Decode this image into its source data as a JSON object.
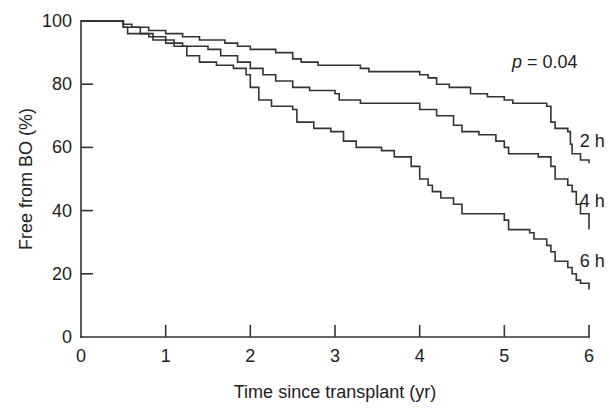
{
  "chart_data": {
    "type": "line",
    "subtype": "kaplan-meier step",
    "title": "",
    "xlabel": "Time since transplant (yr)",
    "ylabel": "Free from BO (%)",
    "xlim": [
      0,
      6
    ],
    "ylim": [
      0,
      100
    ],
    "xticks": [
      0,
      1,
      2,
      3,
      4,
      5,
      6
    ],
    "yticks": [
      0,
      20,
      40,
      60,
      80,
      100
    ],
    "grid": false,
    "annotation": "p = 0.04",
    "annotation_p_symbol": "p",
    "annotation_value": " = 0.04",
    "series": [
      {
        "name": "2 h",
        "points": [
          [
            0,
            100
          ],
          [
            0.25,
            100
          ],
          [
            0.5,
            99
          ],
          [
            0.6,
            98
          ],
          [
            0.8,
            97
          ],
          [
            1.0,
            96
          ],
          [
            1.2,
            95
          ],
          [
            1.4,
            94
          ],
          [
            1.7,
            93
          ],
          [
            1.85,
            92
          ],
          [
            2.0,
            91
          ],
          [
            2.3,
            90
          ],
          [
            2.5,
            88
          ],
          [
            2.6,
            87
          ],
          [
            2.8,
            86
          ],
          [
            3.0,
            86
          ],
          [
            3.3,
            85
          ],
          [
            3.4,
            84
          ],
          [
            3.7,
            84
          ],
          [
            4.0,
            83
          ],
          [
            4.1,
            82
          ],
          [
            4.2,
            80
          ],
          [
            4.35,
            79
          ],
          [
            4.6,
            77
          ],
          [
            4.8,
            76
          ],
          [
            5.0,
            75
          ],
          [
            5.1,
            74
          ],
          [
            5.2,
            74
          ],
          [
            5.5,
            73
          ],
          [
            5.55,
            68
          ],
          [
            5.6,
            66
          ],
          [
            5.75,
            65
          ],
          [
            5.78,
            61
          ],
          [
            5.8,
            58
          ],
          [
            5.9,
            56
          ],
          [
            6.0,
            55
          ]
        ]
      },
      {
        "name": "4 h",
        "points": [
          [
            0,
            100
          ],
          [
            0.3,
            100
          ],
          [
            0.5,
            98
          ],
          [
            0.7,
            96
          ],
          [
            0.85,
            94
          ],
          [
            1.0,
            93
          ],
          [
            1.2,
            92
          ],
          [
            1.5,
            91
          ],
          [
            1.65,
            89
          ],
          [
            1.85,
            87
          ],
          [
            2.0,
            85
          ],
          [
            2.15,
            83
          ],
          [
            2.3,
            81
          ],
          [
            2.5,
            79
          ],
          [
            2.7,
            78
          ],
          [
            3.0,
            77
          ],
          [
            3.05,
            75
          ],
          [
            3.3,
            74
          ],
          [
            3.8,
            74
          ],
          [
            4.0,
            72
          ],
          [
            4.2,
            70
          ],
          [
            4.4,
            67
          ],
          [
            4.5,
            65
          ],
          [
            4.7,
            64
          ],
          [
            4.9,
            62
          ],
          [
            5.0,
            60
          ],
          [
            5.05,
            58
          ],
          [
            5.2,
            58
          ],
          [
            5.4,
            57
          ],
          [
            5.55,
            54
          ],
          [
            5.6,
            50
          ],
          [
            5.75,
            48
          ],
          [
            5.8,
            46
          ],
          [
            5.85,
            42
          ],
          [
            5.9,
            39
          ],
          [
            6.0,
            34
          ]
        ]
      },
      {
        "name": "6 h",
        "points": [
          [
            0,
            100
          ],
          [
            0.3,
            100
          ],
          [
            0.5,
            98
          ],
          [
            0.55,
            96
          ],
          [
            0.8,
            95
          ],
          [
            1.0,
            94
          ],
          [
            1.1,
            92
          ],
          [
            1.25,
            89
          ],
          [
            1.4,
            87
          ],
          [
            1.6,
            86
          ],
          [
            1.8,
            85
          ],
          [
            1.95,
            83
          ],
          [
            2.0,
            79
          ],
          [
            2.1,
            75
          ],
          [
            2.25,
            73
          ],
          [
            2.5,
            72
          ],
          [
            2.55,
            68
          ],
          [
            2.75,
            66
          ],
          [
            2.95,
            65
          ],
          [
            3.1,
            62
          ],
          [
            3.25,
            60
          ],
          [
            3.55,
            59
          ],
          [
            3.7,
            57
          ],
          [
            3.9,
            54
          ],
          [
            4.0,
            50
          ],
          [
            4.1,
            48
          ],
          [
            4.15,
            46
          ],
          [
            4.25,
            44
          ],
          [
            4.4,
            42
          ],
          [
            4.5,
            39
          ],
          [
            4.8,
            39
          ],
          [
            5.0,
            37
          ],
          [
            5.05,
            34
          ],
          [
            5.3,
            33
          ],
          [
            5.35,
            31
          ],
          [
            5.5,
            29
          ],
          [
            5.55,
            27
          ],
          [
            5.6,
            24
          ],
          [
            5.75,
            22
          ],
          [
            5.8,
            20
          ],
          [
            5.85,
            18
          ],
          [
            5.9,
            17
          ],
          [
            6.0,
            15
          ]
        ]
      }
    ],
    "series_labels": [
      {
        "name": "2 h",
        "x": 5.95,
        "y": 62
      },
      {
        "name": "4 h",
        "x": 5.95,
        "y": 43
      },
      {
        "name": "6 h",
        "x": 5.95,
        "y": 24
      }
    ]
  }
}
